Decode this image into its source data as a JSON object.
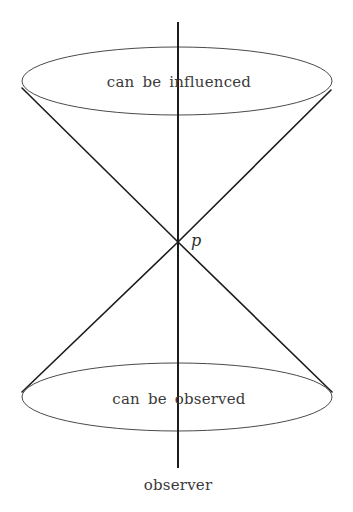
{
  "diagram": {
    "kind": "light-cone",
    "background_color": "#ffffff",
    "stroke_colors": {
      "slant": "#1c1c1c",
      "axis": "#1c1c1c",
      "ellipse": "#4a4a4a",
      "text": "#3a3a3a"
    },
    "labels": {
      "future_cone": "can be influenced",
      "past_cone": "can be observed",
      "worldline": "observer",
      "event_point": "p"
    },
    "geometry": {
      "apex": {
        "x": 178,
        "y": 242
      },
      "top_ellipse": {
        "cx": 177,
        "cy": 81,
        "rx": 155,
        "ry": 34
      },
      "bottom_ellipse": {
        "cx": 177,
        "cy": 397,
        "rx": 155,
        "ry": 34
      },
      "axis_line": {
        "x": 178,
        "y1": 22,
        "y2": 468
      },
      "slant_left_top": {
        "x": 22,
        "y": 88
      },
      "slant_right_top": {
        "x": 331,
        "y": 90
      },
      "slant_left_bottom": {
        "x": 22,
        "y": 392
      },
      "slant_right_bottom": {
        "x": 332,
        "y": 392
      }
    },
    "label_positions": {
      "future_cone": {
        "x": 179,
        "y": 87
      },
      "past_cone": {
        "x": 179,
        "y": 404
      },
      "worldline": {
        "x": 178,
        "y": 490
      },
      "event_point": {
        "x": 196,
        "y": 246
      }
    }
  }
}
